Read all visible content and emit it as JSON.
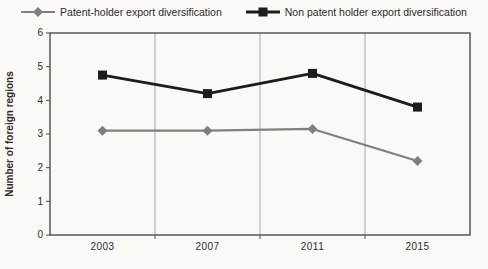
{
  "figure": {
    "background": "#faf9f6"
  },
  "chart_data": {
    "type": "line",
    "title": "",
    "categories": [
      "2003",
      "2007",
      "2011",
      "2015"
    ],
    "series": [
      {
        "name": "Patent-holder export diversification",
        "color": "#7f7f7f",
        "marker": "diamond",
        "values": [
          3.1,
          3.1,
          3.15,
          2.2
        ]
      },
      {
        "name": "Non patent holder export diversification",
        "color": "#1c1c1c",
        "marker": "square",
        "values": [
          4.75,
          4.2,
          4.8,
          3.8
        ]
      }
    ],
    "xlabel": "",
    "ylabel": "Number of foreign regions",
    "ylim": [
      0,
      6
    ],
    "ytick_step": 1,
    "yticks": [
      "0",
      "1",
      "2",
      "3",
      "4",
      "5",
      "6"
    ],
    "grid": "vertical-only",
    "legend_position": "top",
    "colors": {
      "axis": "#4d4d4d",
      "grid": "#a6a6a6",
      "text": "#2b2b2b"
    }
  }
}
